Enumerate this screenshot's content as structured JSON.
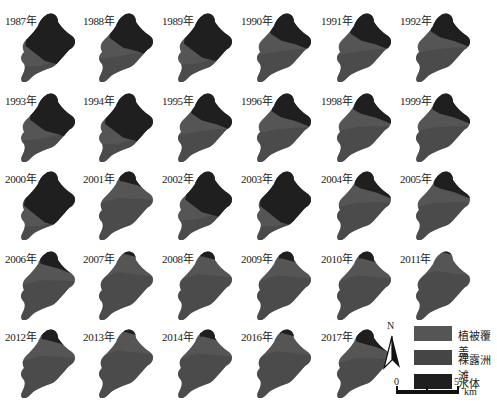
{
  "colors": {
    "vegetation": "#555555",
    "bare_sandbar": "#454545",
    "water": "#1f1f1f"
  },
  "panels": [
    {
      "label": "1987年",
      "water": 0.75
    },
    {
      "label": "1988年",
      "water": 0.55
    },
    {
      "label": "1989年",
      "water": 0.7
    },
    {
      "label": "1990年",
      "water": 0.45
    },
    {
      "label": "1991年",
      "water": 0.45
    },
    {
      "label": "1992年",
      "water": 0.4
    },
    {
      "label": "1993年",
      "water": 0.6
    },
    {
      "label": "1994年",
      "water": 0.7
    },
    {
      "label": "1995年",
      "water": 0.45
    },
    {
      "label": "1996年",
      "water": 0.4
    },
    {
      "label": "1998年",
      "water": 0.35
    },
    {
      "label": "1999年",
      "water": 0.35
    },
    {
      "label": "2000年",
      "water": 0.8
    },
    {
      "label": "2001年",
      "water": 0.2
    },
    {
      "label": "2002年",
      "water": 0.65
    },
    {
      "label": "2003年",
      "water": 0.8
    },
    {
      "label": "2004年",
      "water": 0.3
    },
    {
      "label": "2005年",
      "water": 0.3
    },
    {
      "label": "2006年",
      "water": 0.25
    },
    {
      "label": "2007年",
      "water": 0.08
    },
    {
      "label": "2008年",
      "water": 0.12
    },
    {
      "label": "2009年",
      "water": 0.15
    },
    {
      "label": "2010年",
      "water": 0.15
    },
    {
      "label": "2011年",
      "water": 0.05
    },
    {
      "label": "2012年",
      "water": 0.2
    },
    {
      "label": "2013年",
      "water": 0.08
    },
    {
      "label": "2014年",
      "water": 0.15
    },
    {
      "label": "2016年",
      "water": 0.1
    },
    {
      "label": "2017年",
      "water": 0.25
    }
  ],
  "legend": {
    "items": [
      {
        "label": "植被覆盖",
        "color": "#555555"
      },
      {
        "label": "裸露洲滩",
        "color": "#454545"
      },
      {
        "label": "水体",
        "color": "#1f1f1f"
      }
    ],
    "north_label": "N",
    "scale": {
      "ticks": [
        "0",
        "2.5",
        "5"
      ],
      "unit": "km"
    }
  }
}
